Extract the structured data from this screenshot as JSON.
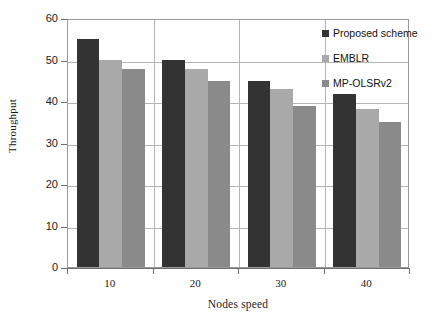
{
  "chart_data": {
    "type": "bar",
    "title": "",
    "xlabel": "Nodes speed",
    "ylabel": "Throughput",
    "categories": [
      "10",
      "20",
      "30",
      "40"
    ],
    "ylim": [
      0,
      60
    ],
    "yticks": [
      0,
      10,
      20,
      30,
      40,
      50,
      60
    ],
    "ytick_labels": [
      "0",
      "10",
      "20",
      "30",
      "40",
      "50",
      "60"
    ],
    "grid": true,
    "grid_axis": "both",
    "legend_position": "top-right",
    "series": [
      {
        "name": "Proposed scheme",
        "color": "#333333",
        "values": [
          55,
          50,
          44.8,
          41.8
        ]
      },
      {
        "name": "EMBLR",
        "color": "#a9a9a9",
        "values": [
          50,
          47.8,
          42.8,
          38
        ]
      },
      {
        "name": "MP-OLSRv2",
        "color": "#8a8a8a",
        "values": [
          47.8,
          44.8,
          38.8,
          35
        ]
      }
    ]
  },
  "legend": {
    "items": [
      {
        "label": "Proposed scheme",
        "color": "#333333"
      },
      {
        "label": "EMBLR",
        "color": "#a9a9a9"
      },
      {
        "label": "MP-OLSRv2",
        "color": "#8a8a8a"
      }
    ]
  },
  "axes": {
    "y_title": "Throughput",
    "x_title": "Nodes speed",
    "y_tick_labels": [
      "60",
      "50",
      "40",
      "30",
      "20",
      "10",
      "0"
    ],
    "x_tick_labels": [
      "10",
      "20",
      "30",
      "40"
    ]
  }
}
